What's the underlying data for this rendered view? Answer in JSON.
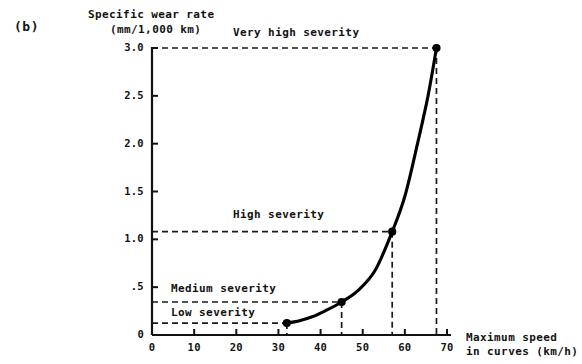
{
  "panel": {
    "label": "(b)"
  },
  "axes": {
    "y_title_line1": "Specific wear rate",
    "y_title_line2": "(mm/1,000 km)",
    "x_title_line1": "Maximum speed",
    "x_title_line2": "in curves (km/h)",
    "y_ticks": [
      "0",
      ".5",
      "1.0",
      "1.5",
      "2.0",
      "2.5",
      "3.0"
    ],
    "x_ticks": [
      "0",
      "10",
      "20",
      "30",
      "40",
      "50",
      "60",
      "70"
    ]
  },
  "severity_bands": {
    "very_high": "Very high severity",
    "high": "High severity",
    "medium": "Medium severity",
    "low": "Low severity"
  },
  "colors": {
    "ink": "#121212",
    "curve": "#000000",
    "dashed": "#1a1a1a",
    "background": "#ffffff"
  },
  "chart_data": {
    "type": "line",
    "title": "",
    "xlabel": "Maximum speed in curves (km/h)",
    "ylabel": "Specific wear rate (mm/1,000 km)",
    "xlim": [
      0,
      70
    ],
    "ylim": [
      0,
      3.0
    ],
    "xticks": [
      0,
      10,
      20,
      30,
      40,
      50,
      60,
      70
    ],
    "yticks": [
      0,
      0.5,
      1.0,
      1.5,
      2.0,
      2.5,
      3.0
    ],
    "grid": false,
    "legend": null,
    "series": [
      {
        "name": "Specific wear rate",
        "x": [
          32.0,
          35.0,
          38.0,
          41.0,
          45.0,
          49.0,
          53.0,
          57.0,
          60.0,
          63.0,
          65.5,
          67.5
        ],
        "y": [
          0.125,
          0.15,
          0.19,
          0.25,
          0.345,
          0.47,
          0.68,
          1.08,
          1.45,
          2.0,
          2.5,
          3.0
        ],
        "markers": [
          {
            "x": 32.0,
            "y": 0.125,
            "band": "Low severity"
          },
          {
            "x": 45.0,
            "y": 0.345,
            "band": "Medium severity"
          },
          {
            "x": 57.0,
            "y": 1.08,
            "band": "High severity"
          },
          {
            "x": 67.5,
            "y": 3.0,
            "band": "Very high severity"
          }
        ]
      }
    ],
    "threshold_lines": [
      {
        "label": "Low severity",
        "y": 0.125,
        "x_end": 32.0
      },
      {
        "label": "Medium severity",
        "y": 0.345,
        "x_end": 45.0
      },
      {
        "label": "High severity",
        "y": 1.08,
        "x_end": 57.0
      },
      {
        "label": "Very high severity",
        "y": 3.0,
        "x_end": 67.5
      }
    ],
    "drop_lines": [
      32.0,
      45.0,
      57.0,
      67.5
    ]
  }
}
